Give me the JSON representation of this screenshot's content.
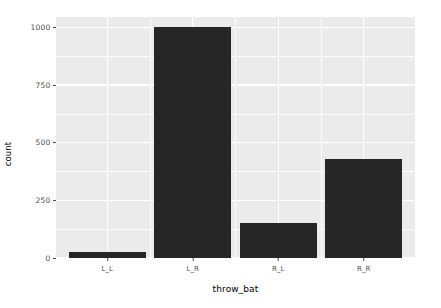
{
  "chart_data": {
    "type": "bar",
    "title": "",
    "subtitle": "",
    "xlabel": "throw_bat",
    "ylabel": "count",
    "categories": [
      "L_L",
      "L_R",
      "R_L",
      "R_R"
    ],
    "values": [
      25,
      1000,
      150,
      430
    ],
    "series": [
      {
        "name": "count",
        "values": [
          25,
          1000,
          150,
          430
        ]
      }
    ],
    "ylim": [
      0,
      1045
    ],
    "y_ticks": [
      0,
      250,
      500,
      750,
      1000
    ],
    "y_tick_labels": [
      "0",
      "250",
      "500",
      "750",
      "1000"
    ],
    "y_minor_ticks": [
      125,
      375,
      625,
      875
    ],
    "x_tick_labels": [
      "L_L",
      "L_R",
      "R_L",
      "R_R"
    ],
    "grid": true,
    "legend": "none",
    "bar_color": "#262626",
    "panel_color": "#ebebeb",
    "grid_color": "#ffffff",
    "axis_text_color": "#4d4d4d",
    "background_color": "#ffffff",
    "annotations": []
  },
  "axes": {
    "y_title": "count",
    "x_title": "throw_bat"
  }
}
